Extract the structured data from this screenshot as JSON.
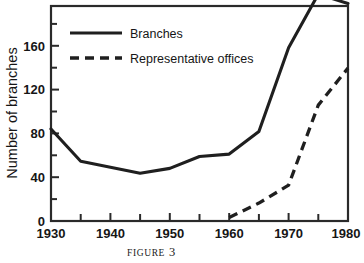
{
  "figure": {
    "caption_word": "FIGURE",
    "caption_number": "3"
  },
  "chart_data": {
    "type": "line",
    "title": "",
    "xlabel": "",
    "ylabel": "Number of branches",
    "x": [
      1930,
      1935,
      1940,
      1945,
      1950,
      1955,
      1960,
      1965,
      1970,
      1975,
      1980
    ],
    "xlim": [
      1930,
      1980
    ],
    "ylim": [
      0,
      180
    ],
    "xticks_major": [
      1930,
      1940,
      1950,
      1960,
      1970,
      1980
    ],
    "xticks_major_labels": [
      "1930",
      "1940",
      "1950",
      "1960",
      "1970",
      "1980"
    ],
    "xticks_minor": [
      1935,
      1945,
      1955,
      1965,
      1975
    ],
    "yticks_major": [
      0,
      40,
      80,
      120,
      160
    ],
    "yticks_major_labels": [
      "0",
      "40",
      "80",
      "120",
      "160"
    ],
    "yticks_minor": [
      20,
      60,
      100,
      140,
      180
    ],
    "grid": false,
    "legend_position": "upper-left-inside",
    "series": [
      {
        "name": "Branches",
        "style": "solid",
        "color": "#1a1a1a",
        "x": [
          1930,
          1935,
          1940,
          1945,
          1950,
          1955,
          1960,
          1965,
          1970,
          1975,
          1980
        ],
        "values": [
          77,
          50,
          45,
          40,
          44,
          54,
          56,
          75,
          145,
          190,
          182
        ]
      },
      {
        "name": "Representative offices",
        "style": "dashed",
        "color": "#1a1a1a",
        "x": [
          1960,
          1965,
          1970,
          1975,
          1980
        ],
        "values": [
          3,
          15,
          30,
          97,
          128
        ]
      }
    ]
  },
  "legend": {
    "items": [
      {
        "label": "Branches",
        "style": "solid"
      },
      {
        "label": "Representative offices",
        "style": "dashed"
      }
    ]
  },
  "axes": {
    "y_title": "Number of branches",
    "y_labels": [
      "160",
      "120",
      "80",
      "40",
      "0"
    ],
    "x_labels": [
      "1930",
      "1940",
      "1950",
      "1960",
      "1970",
      "1980"
    ]
  }
}
